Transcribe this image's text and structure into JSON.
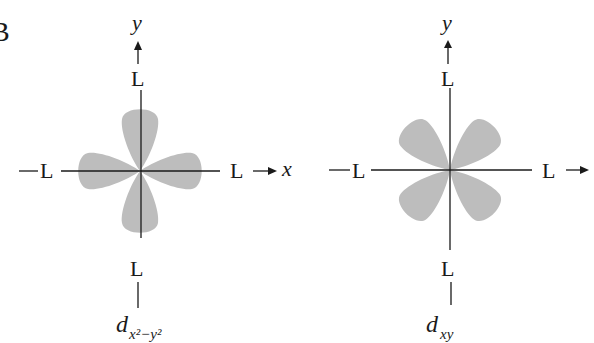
{
  "panel_label": "B",
  "colors": {
    "lobe": "#bdbdbd",
    "line": "#1a1a1a",
    "background": "#ffffff"
  },
  "diagrams": [
    {
      "name": "d-x2-y2",
      "y_axis_label": "y",
      "x_axis_label": "x",
      "ligand_label": "L",
      "orbital_main": "d",
      "orbital_sub": "x²−y²",
      "lobe_orientation": "along axes"
    },
    {
      "name": "d-xy",
      "y_axis_label": "y",
      "x_axis_label": "",
      "ligand_label": "L",
      "orbital_main": "d",
      "orbital_sub": "xy",
      "lobe_orientation": "between axes"
    }
  ]
}
